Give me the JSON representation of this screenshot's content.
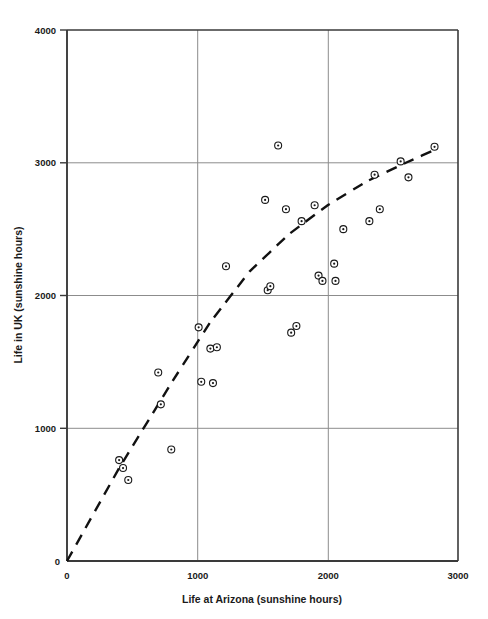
{
  "chart_data": {
    "type": "scatter",
    "title": "",
    "xlabel": "Life at Arizona (sunshine hours)",
    "ylabel": "Life in UK (sunshine hours)",
    "xlim": [
      0,
      3000
    ],
    "ylim": [
      0,
      4000
    ],
    "xticks": [
      0,
      1000,
      2000,
      3000
    ],
    "yticks": [
      0,
      1000,
      2000,
      3000,
      4000
    ],
    "xtick_labels": [
      "0",
      "1000",
      "2000",
      "3000"
    ],
    "ytick_labels": [
      "0",
      "1000",
      "2000",
      "3000",
      "4000"
    ],
    "grid": true,
    "legend": "none",
    "marker": "circle-with-center-dot",
    "points": [
      {
        "x": 400,
        "y": 760
      },
      {
        "x": 430,
        "y": 700
      },
      {
        "x": 470,
        "y": 610
      },
      {
        "x": 700,
        "y": 1420
      },
      {
        "x": 720,
        "y": 1180
      },
      {
        "x": 800,
        "y": 840
      },
      {
        "x": 1010,
        "y": 1760
      },
      {
        "x": 1030,
        "y": 1350
      },
      {
        "x": 1120,
        "y": 1340
      },
      {
        "x": 1100,
        "y": 1600
      },
      {
        "x": 1150,
        "y": 1610
      },
      {
        "x": 1220,
        "y": 2220
      },
      {
        "x": 1520,
        "y": 2720
      },
      {
        "x": 1540,
        "y": 2040
      },
      {
        "x": 1560,
        "y": 2070
      },
      {
        "x": 1620,
        "y": 3130
      },
      {
        "x": 1680,
        "y": 2650
      },
      {
        "x": 1720,
        "y": 1720
      },
      {
        "x": 1760,
        "y": 1770
      },
      {
        "x": 1800,
        "y": 2560
      },
      {
        "x": 1900,
        "y": 2680
      },
      {
        "x": 1930,
        "y": 2150
      },
      {
        "x": 1960,
        "y": 2110
      },
      {
        "x": 2050,
        "y": 2240
      },
      {
        "x": 2060,
        "y": 2110
      },
      {
        "x": 2120,
        "y": 2500
      },
      {
        "x": 2320,
        "y": 2560
      },
      {
        "x": 2360,
        "y": 2910
      },
      {
        "x": 2400,
        "y": 2650
      },
      {
        "x": 2560,
        "y": 3010
      },
      {
        "x": 2620,
        "y": 2890
      },
      {
        "x": 2820,
        "y": 3120
      }
    ],
    "trend": {
      "style": "dashed",
      "shape": "concave-curve",
      "points": [
        {
          "x": 0,
          "y": 0
        },
        {
          "x": 400,
          "y": 700
        },
        {
          "x": 800,
          "y": 1340
        },
        {
          "x": 1100,
          "y": 1800
        },
        {
          "x": 1400,
          "y": 2180
        },
        {
          "x": 1700,
          "y": 2460
        },
        {
          "x": 2000,
          "y": 2680
        },
        {
          "x": 2300,
          "y": 2860
        },
        {
          "x": 2600,
          "y": 3000
        },
        {
          "x": 2850,
          "y": 3110
        }
      ]
    }
  },
  "colors": {
    "axis": "#3a3a3a",
    "grid": "#8c8c8c",
    "marker": "#1a1a1a",
    "trend": "#111111",
    "background": "#ffffff"
  },
  "caption": {
    "cropped_text": ""
  }
}
